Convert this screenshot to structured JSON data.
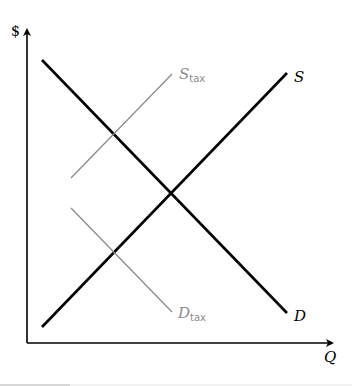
{
  "diagram": {
    "axes": {
      "y_label": "$",
      "x_label": "Q"
    },
    "curves": [
      {
        "id": "D",
        "label": "D",
        "subscript": "",
        "color": "#000000",
        "from": [
          42,
          60
        ],
        "to": [
          287,
          313
        ]
      },
      {
        "id": "S",
        "label": "S",
        "subscript": "",
        "color": "#000000",
        "from": [
          42,
          327
        ],
        "to": [
          287,
          73
        ]
      },
      {
        "id": "S_tax",
        "label": "S",
        "subscript": "tax",
        "color": "#8c8c8c",
        "from": [
          71,
          178
        ],
        "to": [
          172,
          74
        ]
      },
      {
        "id": "D_tax",
        "label": "D",
        "subscript": "tax",
        "color": "#8c8c8c",
        "from": [
          71,
          208
        ],
        "to": [
          172,
          312
        ]
      }
    ],
    "equilibrium": [
      171,
      193
    ]
  }
}
